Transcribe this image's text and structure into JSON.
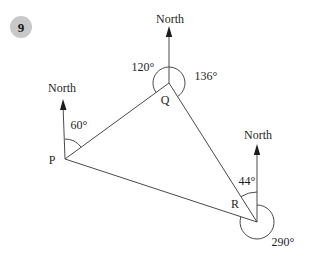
{
  "badge": {
    "number": "9"
  },
  "colors": {
    "badge_bg": "#c8c8c8",
    "ink": "#1f1f1f",
    "line": "#4a4a4a"
  },
  "icons": {
    "north_arrow": "filled-up-arrow"
  },
  "diagram": {
    "type": "bearings-triangle",
    "points": {
      "p": {
        "label": "P",
        "north_label": "North",
        "angle_label": "60°"
      },
      "q": {
        "label": "Q",
        "north_label": "North",
        "angle_left_label": "120°",
        "angle_right_label": "136°"
      },
      "r": {
        "label": "R",
        "north_label": "North",
        "angle_label": "44°",
        "reflex_angle_label": "290°"
      }
    }
  }
}
